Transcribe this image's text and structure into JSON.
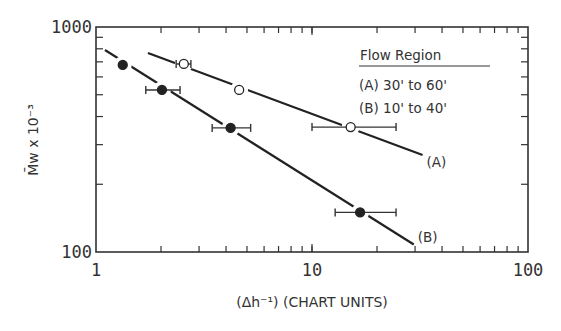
{
  "chart_data": {
    "type": "scatter",
    "title": "",
    "xlabel": "(Δh⁻¹) (CHART UNITS)",
    "ylabel": "M̄w x 10⁻³",
    "xscale": "log",
    "yscale": "log",
    "xlim": [
      1,
      100
    ],
    "ylim": [
      100,
      1000
    ],
    "x_tick_labels": [
      "1",
      "10",
      "100"
    ],
    "y_tick_labels": [
      "100",
      "1000"
    ],
    "grid": false,
    "legend": {
      "title": "Flow Region",
      "entries": [
        "(A) 30' to 60'",
        "(B) 10' to 40'"
      ],
      "position": "upper right"
    },
    "series": [
      {
        "name": "(A) 30' to 60'",
        "label": "(A)",
        "marker": "open-circle",
        "points": [
          {
            "x": 2.55,
            "y": 685,
            "xerr": [
              2.35,
              2.75
            ]
          },
          {
            "x": 4.6,
            "y": 525
          },
          {
            "x": 15.1,
            "y": 359,
            "xerr": [
              10.0,
              24.5
            ]
          }
        ],
        "fit_line": {
          "x": [
            1.74,
            32.5
          ],
          "y": [
            766,
            270
          ]
        }
      },
      {
        "name": "(B) 10' to 40'",
        "label": "(B)",
        "marker": "filled-circle",
        "points": [
          {
            "x": 1.33,
            "y": 678
          },
          {
            "x": 2.02,
            "y": 525,
            "xerr": [
              1.7,
              2.45
            ]
          },
          {
            "x": 4.2,
            "y": 356,
            "xerr": [
              3.45,
              5.2
            ]
          },
          {
            "x": 16.7,
            "y": 150,
            "xerr": [
              12.8,
              24.5
            ]
          }
        ],
        "fit_line": {
          "x": [
            1.1,
            29.6
          ],
          "y": [
            790,
            108
          ]
        }
      }
    ]
  }
}
